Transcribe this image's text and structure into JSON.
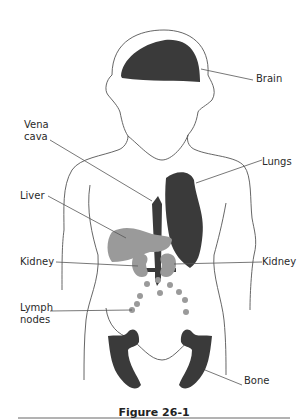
{
  "figure": {
    "caption": "Figure 26-1",
    "colors": {
      "outline": "#555555",
      "dark_organ": "#3a3a3a",
      "gray_organ": "#9a9a9a",
      "background": "#ffffff"
    },
    "labels": {
      "brain": "Brain",
      "vena_cava": "Vena\ncava",
      "lungs": "Lungs",
      "liver": "Liver",
      "kidney_left": "Kidney",
      "kidney_right": "Kidney",
      "lymph_nodes": "Lymph\nnodes",
      "bone": "Bone"
    }
  }
}
